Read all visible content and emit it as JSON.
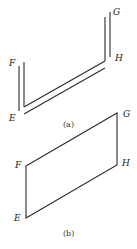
{
  "figure_a": {
    "caption": "(a)",
    "labels": {
      "F": "F",
      "E": "E",
      "G": "G",
      "H": "H"
    },
    "description": "Strip bent into two parallel vertical segments at E-F and G-H joined by a double diagonal"
  },
  "figure_b": {
    "caption": "(b)",
    "labels": {
      "F": "F",
      "E": "E",
      "G": "G",
      "H": "H"
    },
    "description": "Parallelogram EFGH with vertical sides EF and HG"
  },
  "colors": {
    "line": "#2a2a2a",
    "background": "#ffffff"
  }
}
